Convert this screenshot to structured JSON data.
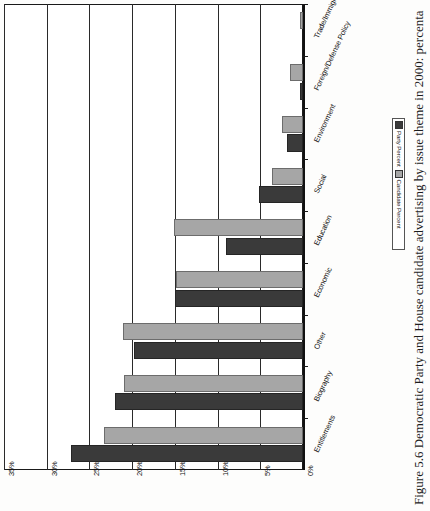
{
  "figure": {
    "caption": "Figure 5.6  Democratic Party and House candidate advertising by issue theme in 2000: percenta",
    "orientation": "page-rotated-90-ccw"
  },
  "legend": {
    "entries": [
      {
        "label": "Party Percent",
        "color": "#3a3a3a",
        "icon": "square-swatch"
      },
      {
        "label": "Candidate Percent",
        "color": "#a6a6a6",
        "icon": "square-swatch"
      }
    ]
  },
  "axis": {
    "value_ticks": [
      "35%",
      "30%",
      "25%",
      "20%",
      "15%",
      "10%",
      "5%",
      "0%"
    ],
    "value_tick_numbers": [
      35,
      30,
      25,
      20,
      15,
      10,
      5,
      0
    ]
  },
  "chart_data": {
    "type": "bar",
    "orientation": "horizontal",
    "title": "",
    "subtitle": "",
    "xlabel": "",
    "ylabel": "",
    "xlim": [
      0,
      35
    ],
    "grid": true,
    "legend_position": "below-right",
    "categories": [
      "Entitlements",
      "Biography",
      "Other",
      "Economic",
      "Education",
      "Social",
      "Environment",
      "Foreign/Defense Policy",
      "Trade/Immigration"
    ],
    "series": [
      {
        "name": "Party Percent",
        "color": "#3a3a3a",
        "values": [
          27.2,
          22.0,
          19.8,
          15.0,
          9.0,
          5.2,
          1.9,
          0.3,
          0.0
        ]
      },
      {
        "name": "Candidate Percent",
        "color": "#a6a6a6",
        "values": [
          23.3,
          20.9,
          21.1,
          14.9,
          15.1,
          3.6,
          2.5,
          1.5,
          0.4
        ]
      }
    ],
    "value_unit": "%"
  }
}
